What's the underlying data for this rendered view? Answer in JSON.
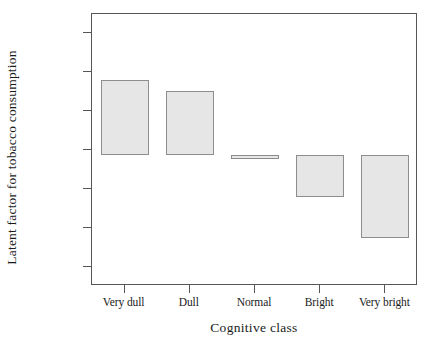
{
  "chart_data": {
    "type": "bar",
    "title": "",
    "xlabel": "Cognitive class",
    "ylabel": "Latent factor for tobacco consumption",
    "categories": [
      "Very dull",
      "Dull",
      "Normal",
      "Bright",
      "Very bright"
    ],
    "values": [
      0.36,
      0.305,
      -0.025,
      -0.24,
      -0.455
    ],
    "bar_base": -0.025,
    "ylim": [
      -0.7,
      0.7
    ],
    "yticks": [
      0.6,
      0.4,
      0.2,
      0.0,
      -0.2,
      -0.4,
      -0.6
    ],
    "ytick_labels": [
      "0.60000",
      "0.40000",
      "0.20000",
      "0.00000",
      "-0.20000",
      "-0.40000",
      "-0.60000"
    ],
    "grid": false,
    "legend": null,
    "bar_fill_color": "#e6e6e6",
    "bar_border_color": "#8d8d8d",
    "axis_color": "#565656",
    "background_color": "#ffffff"
  }
}
